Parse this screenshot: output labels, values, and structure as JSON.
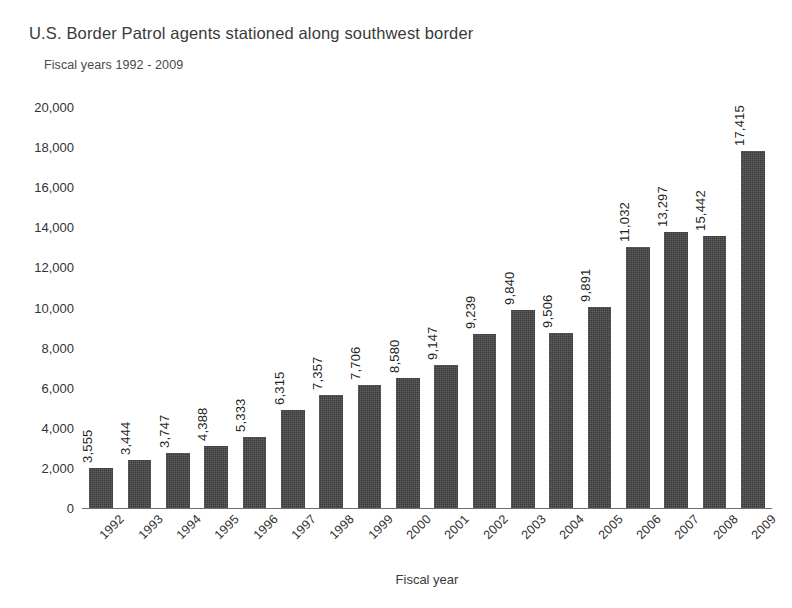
{
  "chart_data": {
    "type": "bar",
    "title": "U.S. Border Patrol agents stationed along southwest border",
    "subtitle": "Fiscal years 1992 - 2009",
    "xlabel": "Fiscal year",
    "ylabel": "",
    "ylim": [
      0,
      20000
    ],
    "ytick_step": 2000,
    "grid": false,
    "legend": "none",
    "bar_color": "#3a3a3a",
    "value_labels_rotated": true,
    "tick_labels_rotated": true,
    "yticks": [
      "20,000",
      "18,000",
      "16,000",
      "14,000",
      "12,000",
      "10,000",
      "8,000",
      "6,000",
      "4,000",
      "2,000",
      "0"
    ],
    "ytick_values": [
      20000,
      18000,
      16000,
      14000,
      12000,
      10000,
      8000,
      6000,
      4000,
      2000,
      0
    ],
    "categories": [
      "1992",
      "1993",
      "1994",
      "1995",
      "1996",
      "1997",
      "1998",
      "1999",
      "2000",
      "2001",
      "2002",
      "2003",
      "2004",
      "2005",
      "2006",
      "2007",
      "2008",
      "2009"
    ],
    "values": [
      3555,
      3444,
      3747,
      4388,
      5333,
      6315,
      7357,
      7706,
      8580,
      9147,
      9239,
      9840,
      9506,
      9891,
      11032,
      13297,
      15442,
      17415
    ],
    "value_labels": [
      "3,555",
      "3,444",
      "3,747",
      "4,388",
      "5,333",
      "6,315",
      "7,357",
      "7,706",
      "8,580",
      "9,147",
      "9,239",
      "9,840",
      "9,506",
      "9,891",
      "11,032",
      "13,297",
      "15,442",
      "17,415"
    ],
    "drawn_bar_values": [
      2020,
      2400,
      2740,
      3080,
      3520,
      4900,
      5620,
      6150,
      6500,
      7120,
      8700,
      9870,
      8740,
      10040,
      13000,
      13750,
      13560,
      17800
    ]
  }
}
